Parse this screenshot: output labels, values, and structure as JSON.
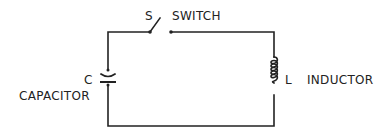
{
  "diagram": {
    "type": "circuit",
    "components": [
      {
        "id": "switch",
        "symbol": "S",
        "label": "SWITCH",
        "state": "open"
      },
      {
        "id": "capacitor",
        "symbol": "C",
        "label": "CAPACITOR"
      },
      {
        "id": "inductor",
        "symbol": "L",
        "label": "INDUCTOR"
      }
    ],
    "connections": [
      [
        "capacitor",
        "switch"
      ],
      [
        "switch",
        "inductor"
      ],
      [
        "inductor",
        "capacitor"
      ]
    ]
  },
  "labels": {
    "switch_symbol": "S",
    "switch_name": "SWITCH",
    "capacitor_symbol": "C",
    "capacitor_name": "CAPACITOR",
    "inductor_symbol": "L",
    "inductor_name": "INDUCTOR"
  },
  "colors": {
    "ink": "#222222",
    "background": "#ffffff"
  }
}
